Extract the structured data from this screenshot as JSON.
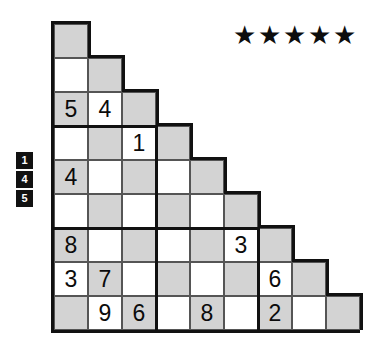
{
  "puzzle": {
    "type": "staircase-sudoku",
    "cell_size": 34,
    "rows": 9,
    "difficulty": {
      "label": "5 stars",
      "value": 5,
      "max": 5,
      "star_glyph": "★"
    },
    "clue_badges": [
      {
        "value": "1"
      },
      {
        "value": "4"
      },
      {
        "value": "5"
      }
    ],
    "shade_color": "#d3d3d3",
    "plain_color": "#ffffff",
    "line_color": "#111111",
    "grid_rows": [
      {
        "index": 0,
        "length": 1,
        "cells": [
          {
            "col": 0,
            "value": "",
            "shaded": true
          }
        ]
      },
      {
        "index": 1,
        "length": 2,
        "cells": [
          {
            "col": 0,
            "value": "",
            "shaded": false
          },
          {
            "col": 1,
            "value": "",
            "shaded": true
          }
        ]
      },
      {
        "index": 2,
        "length": 3,
        "cells": [
          {
            "col": 0,
            "value": "5",
            "shaded": true
          },
          {
            "col": 1,
            "value": "4",
            "shaded": false
          },
          {
            "col": 2,
            "value": "",
            "shaded": true
          }
        ]
      },
      {
        "index": 3,
        "length": 4,
        "cells": [
          {
            "col": 0,
            "value": "",
            "shaded": false
          },
          {
            "col": 1,
            "value": "",
            "shaded": true
          },
          {
            "col": 2,
            "value": "1",
            "shaded": false
          },
          {
            "col": 3,
            "value": "",
            "shaded": true
          }
        ]
      },
      {
        "index": 4,
        "length": 5,
        "cells": [
          {
            "col": 0,
            "value": "4",
            "shaded": true
          },
          {
            "col": 1,
            "value": "",
            "shaded": false
          },
          {
            "col": 2,
            "value": "",
            "shaded": true
          },
          {
            "col": 3,
            "value": "",
            "shaded": false
          },
          {
            "col": 4,
            "value": "",
            "shaded": true
          }
        ]
      },
      {
        "index": 5,
        "length": 6,
        "cells": [
          {
            "col": 0,
            "value": "",
            "shaded": false
          },
          {
            "col": 1,
            "value": "",
            "shaded": true
          },
          {
            "col": 2,
            "value": "",
            "shaded": false
          },
          {
            "col": 3,
            "value": "",
            "shaded": true
          },
          {
            "col": 4,
            "value": "",
            "shaded": false
          },
          {
            "col": 5,
            "value": "",
            "shaded": true
          }
        ]
      },
      {
        "index": 6,
        "length": 7,
        "cells": [
          {
            "col": 0,
            "value": "8",
            "shaded": true
          },
          {
            "col": 1,
            "value": "",
            "shaded": false
          },
          {
            "col": 2,
            "value": "",
            "shaded": true
          },
          {
            "col": 3,
            "value": "",
            "shaded": false
          },
          {
            "col": 4,
            "value": "",
            "shaded": true
          },
          {
            "col": 5,
            "value": "3",
            "shaded": false
          },
          {
            "col": 6,
            "value": "",
            "shaded": true
          }
        ]
      },
      {
        "index": 7,
        "length": 8,
        "cells": [
          {
            "col": 0,
            "value": "3",
            "shaded": false
          },
          {
            "col": 1,
            "value": "7",
            "shaded": true
          },
          {
            "col": 2,
            "value": "",
            "shaded": false
          },
          {
            "col": 3,
            "value": "",
            "shaded": true
          },
          {
            "col": 4,
            "value": "",
            "shaded": false
          },
          {
            "col": 5,
            "value": "",
            "shaded": true
          },
          {
            "col": 6,
            "value": "6",
            "shaded": false
          },
          {
            "col": 7,
            "value": "",
            "shaded": true
          }
        ]
      },
      {
        "index": 8,
        "length": 9,
        "cells": [
          {
            "col": 0,
            "value": "",
            "shaded": true
          },
          {
            "col": 1,
            "value": "9",
            "shaded": false
          },
          {
            "col": 2,
            "value": "6",
            "shaded": true
          },
          {
            "col": 3,
            "value": "",
            "shaded": false
          },
          {
            "col": 4,
            "value": "8",
            "shaded": true
          },
          {
            "col": 5,
            "value": "",
            "shaded": false
          },
          {
            "col": 6,
            "value": "2",
            "shaded": true
          },
          {
            "col": 7,
            "value": "",
            "shaded": false
          },
          {
            "col": 8,
            "value": "",
            "shaded": true
          }
        ]
      }
    ]
  }
}
